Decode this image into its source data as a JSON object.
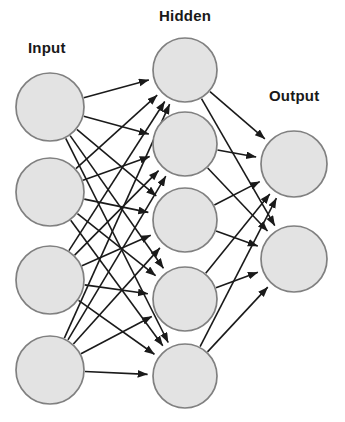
{
  "diagram": {
    "type": "neural-network",
    "background_color": "#ffffff",
    "node_fill_color": "#e3e3e3",
    "node_stroke_color": "#808080",
    "edge_color": "#1a1a1a",
    "label_color": "#191919",
    "node_radius": 33,
    "hidden_node_radius": 32,
    "edge_width": 1.6,
    "labels": {
      "input": "Input",
      "hidden": "Hidden",
      "output": "Output"
    },
    "layers": [
      {
        "id": "input",
        "name": "Input",
        "label": "Input",
        "node_count": 4,
        "x": 50,
        "radius": 34,
        "nodes": [
          {
            "id": "i1",
            "cx": 50,
            "cy": 107,
            "r": 34
          },
          {
            "id": "i2",
            "cx": 50,
            "cy": 192,
            "r": 34
          },
          {
            "id": "i3",
            "cx": 50,
            "cy": 280,
            "r": 34
          },
          {
            "id": "i4",
            "cx": 50,
            "cy": 370,
            "r": 34
          }
        ]
      },
      {
        "id": "hidden",
        "name": "Hidden",
        "label": "Hidden",
        "node_count": 5,
        "x": 185,
        "radius": 32,
        "nodes": [
          {
            "id": "h1",
            "cx": 185,
            "cy": 70,
            "r": 32
          },
          {
            "id": "h2",
            "cx": 185,
            "cy": 144,
            "r": 32
          },
          {
            "id": "h3",
            "cx": 185,
            "cy": 220,
            "r": 32
          },
          {
            "id": "h4",
            "cx": 185,
            "cy": 299,
            "r": 32
          },
          {
            "id": "h5",
            "cx": 185,
            "cy": 376,
            "r": 32
          }
        ]
      },
      {
        "id": "output",
        "name": "Output",
        "label": "Output",
        "node_count": 2,
        "x": 294,
        "radius": 33,
        "nodes": [
          {
            "id": "o1",
            "cx": 294,
            "cy": 164,
            "r": 33
          },
          {
            "id": "o2",
            "cx": 294,
            "cy": 259,
            "r": 33
          }
        ]
      }
    ],
    "connections": {
      "input_to_hidden": "fully-connected",
      "hidden_to_output": "fully-connected",
      "input_to_hidden_count": 20,
      "hidden_to_output_count": 10,
      "total_edges": 30,
      "arrowheads": true,
      "direction": "left-to-right"
    }
  }
}
